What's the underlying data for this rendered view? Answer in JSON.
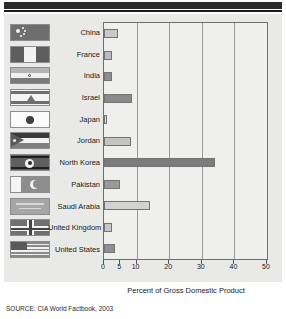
{
  "figure": {
    "source_note": "SOURCE: CIA World Factbook, 2003"
  },
  "chart_data": {
    "type": "bar",
    "orientation": "horizontal",
    "title": "",
    "xlabel": "Percent of Gross Domestic Product",
    "ylabel": "",
    "xlim": [
      0,
      50
    ],
    "xticks": [
      0,
      5,
      10,
      20,
      30,
      40,
      50
    ],
    "xticklabels": [
      "0",
      "5",
      "10",
      "20",
      "30",
      "40",
      "50"
    ],
    "grid": true,
    "gridlines": [
      10,
      20,
      30,
      40
    ],
    "legend": "none",
    "categories": [
      "China",
      "France",
      "India",
      "Israel",
      "Japan",
      "Jordan",
      "North Korea",
      "Pakistan",
      "Saudi Arabia",
      "United Kingdom",
      "United States"
    ],
    "values": [
      4.3,
      2.6,
      2.5,
      8.7,
      1.0,
      8.4,
      34.0,
      4.9,
      14.2,
      2.4,
      3.3
    ],
    "bar_colors": [
      "#c9c9c9",
      "#bdbdbd",
      "#8e8e8e",
      "#8a8a8a",
      "#d8d8d8",
      "#c4c4c4",
      "#7c7c7c",
      "#9a9a9a",
      "#d2d2d2",
      "#c6c6c6",
      "#8f8f8f"
    ]
  },
  "flags": [
    {
      "name": "flag-china",
      "country": "China"
    },
    {
      "name": "flag-france",
      "country": "France"
    },
    {
      "name": "flag-india",
      "country": "India"
    },
    {
      "name": "flag-israel",
      "country": "Israel"
    },
    {
      "name": "flag-japan",
      "country": "Japan"
    },
    {
      "name": "flag-jordan",
      "country": "Jordan"
    },
    {
      "name": "flag-north-korea",
      "country": "North Korea"
    },
    {
      "name": "flag-pakistan",
      "country": "Pakistan"
    },
    {
      "name": "flag-saudi-arabia",
      "country": "Saudi Arabia"
    },
    {
      "name": "flag-united-kingdom",
      "country": "United Kingdom"
    },
    {
      "name": "flag-united-states",
      "country": "United States"
    }
  ],
  "colors": {
    "header_band": "#2b2b2b",
    "panel_background": "#e9e9e7",
    "plot_background": "#efefed",
    "axis": "#6e6e6e",
    "gridline": "#9a9a9a",
    "text": "#1a1a1a"
  }
}
